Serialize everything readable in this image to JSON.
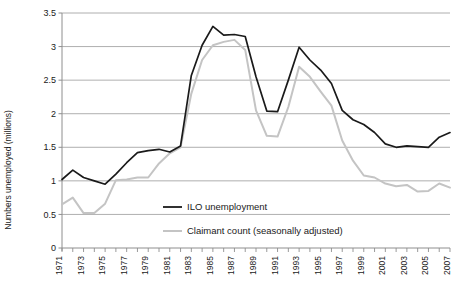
{
  "chart_data": {
    "type": "line",
    "title": "",
    "xlabel": "",
    "ylabel": "Numbers unemployed (millions)",
    "ylim": [
      0,
      3.5
    ],
    "xlim": [
      1971,
      2007
    ],
    "grid": true,
    "legend_position": "inside-lower-center",
    "y_ticks": [
      "0",
      "0.5",
      "1",
      "1.5",
      "2",
      "2.5",
      "3",
      "3.5"
    ],
    "y_tick_values": [
      0,
      0.5,
      1,
      1.5,
      2,
      2.5,
      3,
      3.5
    ],
    "x_tick_labels": [
      "1971",
      "1973",
      "1975",
      "1977",
      "1979",
      "1981",
      "1983",
      "1985",
      "1987",
      "1989",
      "1991",
      "1993",
      "1995",
      "1997",
      "1999",
      "2001",
      "2003",
      "2005",
      "2007"
    ],
    "x_minor_ticks": [
      1972,
      1974,
      1976,
      1978,
      1980,
      1982,
      1984,
      1986,
      1988,
      1990,
      1992,
      1994,
      1996,
      1998,
      2000,
      2002,
      2004,
      2006
    ],
    "x": [
      1971,
      1972,
      1973,
      1974,
      1975,
      1976,
      1977,
      1978,
      1979,
      1980,
      1981,
      1982,
      1983,
      1984,
      1985,
      1986,
      1987,
      1988,
      1989,
      1990,
      1991,
      1992,
      1993,
      1994,
      1995,
      1996,
      1997,
      1998,
      1999,
      2000,
      2001,
      2002,
      2003,
      2004,
      2005,
      2006,
      2007
    ],
    "series": [
      {
        "name": "ILO unemployment",
        "color": "#1a1a1a",
        "values": [
          1.02,
          1.16,
          1.05,
          1.0,
          0.95,
          1.1,
          1.27,
          1.42,
          1.45,
          1.47,
          1.43,
          1.52,
          2.57,
          3.02,
          3.3,
          3.17,
          3.18,
          3.15,
          2.55,
          2.04,
          2.03,
          2.5,
          2.99,
          2.8,
          2.65,
          2.45,
          2.05,
          1.91,
          1.84,
          1.72,
          1.55,
          1.5,
          1.52,
          1.51,
          1.5,
          1.65,
          1.72
        ]
      },
      {
        "name": "Claimant count (seasonally adjusted)",
        "color": "#c4c4c4",
        "values": [
          0.65,
          0.75,
          0.52,
          0.52,
          0.66,
          1.01,
          1.02,
          1.05,
          1.05,
          1.26,
          1.41,
          1.5,
          2.3,
          2.8,
          3.02,
          3.07,
          3.1,
          2.95,
          2.05,
          1.67,
          1.66,
          2.1,
          2.7,
          2.55,
          2.33,
          2.12,
          1.6,
          1.3,
          1.08,
          1.05,
          0.96,
          0.92,
          0.94,
          0.84,
          0.85,
          0.96,
          0.9
        ]
      }
    ]
  },
  "legend": {
    "entries": [
      {
        "label": "ILO unemployment",
        "color": "#1a1a1a"
      },
      {
        "label": "Claimant count (seasonally adjusted)",
        "color": "#c4c4c4"
      }
    ]
  },
  "axis": {
    "y_title": "Numbers unemployed (millions)"
  },
  "source": {
    "text": ""
  }
}
